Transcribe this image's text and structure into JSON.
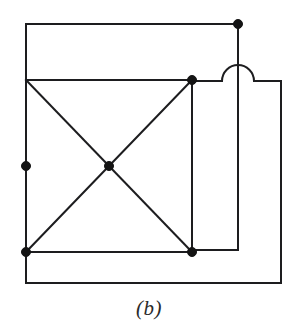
{
  "figure": {
    "caption": "(b)",
    "background_color": "#ffffff",
    "line_color": "#1d1d1f",
    "node_color": "#141414",
    "line_width": 2,
    "node_radius": 4.5,
    "width": 298,
    "height": 336
  },
  "nodes": [
    {
      "id": "n-top-left",
      "label": "top-left-node",
      "x": 26,
      "y": 80,
      "r": 4.5
    },
    {
      "id": "n-mid-left",
      "label": "mid-left-node",
      "x": 26,
      "y": 166,
      "r": 4.5
    },
    {
      "id": "n-bottom-left",
      "label": "bottom-left-node",
      "x": 26,
      "y": 252,
      "r": 4.5
    },
    {
      "id": "n-center",
      "label": "center-node",
      "x": 109,
      "y": 166,
      "r": 4.5
    },
    {
      "id": "n-top-right",
      "label": "top-right-node",
      "x": 192,
      "y": 80,
      "r": 4.5
    },
    {
      "id": "n-bottom-right",
      "label": "bottom-right-node",
      "x": 192,
      "y": 252,
      "r": 4.5
    },
    {
      "id": "n-corner-top",
      "label": "upper-corner-node",
      "x": 238,
      "y": 24,
      "r": 4.5
    }
  ],
  "edges": [
    {
      "id": "e-square-top",
      "label": "top-edge",
      "d": "M 26 80 L 192 80"
    },
    {
      "id": "e-square-left",
      "label": "left-edge",
      "d": "M 26 80 L 26 252"
    },
    {
      "id": "e-square-bottom",
      "label": "bottom-edge",
      "d": "M 26 252 L 192 252"
    },
    {
      "id": "e-square-right",
      "label": "right-edge",
      "d": "M 192 80 L 192 252"
    },
    {
      "id": "e-diag-nw-se",
      "label": "diagonal-nw-se",
      "d": "M 26 80 L 192 252"
    },
    {
      "id": "e-diag-sw-ne",
      "label": "diagonal-sw-ne",
      "d": "M 26 252 L 192 80"
    },
    {
      "id": "e-outer-top",
      "label": "outer-top-loop",
      "d": "M 26 80 L 26 24 L 238 24"
    },
    {
      "id": "e-corner-vertical",
      "label": "corner-vertical-run",
      "d": "M 238 24 L 238 250 L 192 250"
    },
    {
      "id": "e-outer-bottom",
      "label": "outer-bottom-loop",
      "d": "M 26 252 L 26 283 L 281 283 L 281 81 L 254 81"
    }
  ],
  "hop": {
    "id": "e-hop-arc",
    "label": "wire-crossover-hop",
    "d": "M 192 81 L 222 81 A 16 16 0 0 1 254 81",
    "crosses_over": "corner-vertical-run",
    "center_x": 238,
    "center_y": 81,
    "radius": 16
  }
}
